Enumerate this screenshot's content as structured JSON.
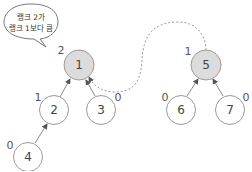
{
  "diagram": {
    "type": "union-find-trees",
    "colors": {
      "highlight_fill": "#dcdcdc",
      "normal_fill": "#ffffff",
      "stroke": "#9a9a9a"
    },
    "speech_bubble": {
      "line1": "랭크 2가",
      "line2": "랭크 1보다 큼"
    },
    "nodes": [
      {
        "id": "1",
        "label": "1",
        "rank": "2",
        "highlighted": true
      },
      {
        "id": "2",
        "label": "2",
        "rank": "1",
        "highlighted": false
      },
      {
        "id": "3",
        "label": "3",
        "rank": "0",
        "highlighted": false
      },
      {
        "id": "4",
        "label": "4",
        "rank": "0",
        "highlighted": false
      },
      {
        "id": "5",
        "label": "5",
        "rank": "1",
        "highlighted": true
      },
      {
        "id": "6",
        "label": "6",
        "rank": "0",
        "highlighted": false
      },
      {
        "id": "7",
        "label": "7",
        "rank": "0",
        "highlighted": false
      }
    ],
    "edges": [
      {
        "from": "2",
        "to": "1"
      },
      {
        "from": "3",
        "to": "1"
      },
      {
        "from": "4",
        "to": "2"
      },
      {
        "from": "6",
        "to": "5"
      },
      {
        "from": "7",
        "to": "5"
      },
      {
        "from": "5",
        "to": "1",
        "style": "dashed"
      }
    ]
  }
}
